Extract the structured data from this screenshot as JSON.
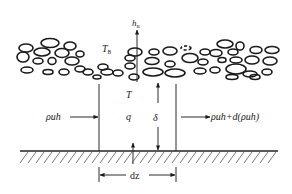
{
  "diagram": {
    "type": "heat-transfer control volume under porous/pebble layer",
    "labels": {
      "h_main": "h",
      "h_sub": "B",
      "T_B_main": "T",
      "T_B_sub": "B",
      "T": "T",
      "q": "q",
      "delta": "δ",
      "inflow": "ρuh",
      "outflow": "ρuh+d(ρuh)",
      "dz": "dz"
    },
    "elements": {
      "pebble_layer": "irregular pebble/ellipse layer (porous bed)",
      "control_volume": "two vertical boundaries separated by dz",
      "ground": "hatched solid surface",
      "arrows": [
        "h_B upward heat flux",
        "ρuh inflow",
        "ρuh+d(ρuh) outflow",
        "δ thickness arrows",
        "dz width dimension"
      ]
    },
    "colors": {
      "ink": "#1a1a1a",
      "background": "#ffffff"
    }
  }
}
